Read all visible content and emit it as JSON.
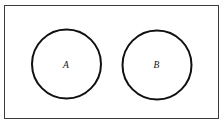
{
  "figure": {
    "type": "venn-diagram",
    "caption": "",
    "background_color": "#ffffff",
    "canvas": {
      "width": 224,
      "height": 125
    },
    "universe": {
      "label": "",
      "shape": "rectangle",
      "x": 4.5,
      "y": 5.5,
      "width": 214,
      "height": 113,
      "stroke_color": "#3c3c3c",
      "stroke_width": 1,
      "fill_color": "#ffffff"
    },
    "sets": [
      {
        "label": "A",
        "shape": "circle",
        "cx": 66.5,
        "cy": 64,
        "r": 34.5,
        "stroke_color": "#101010",
        "stroke_width": 2,
        "fill_color": "#ffffff",
        "label_x": 66,
        "label_y": 64.5
      },
      {
        "label": "B",
        "shape": "circle",
        "cx": 157,
        "cy": 65,
        "r": 34.5,
        "stroke_color": "#101010",
        "stroke_width": 2,
        "fill_color": "#ffffff",
        "label_x": 156.5,
        "label_y": 64.5
      }
    ],
    "relationship": "disjoint"
  }
}
